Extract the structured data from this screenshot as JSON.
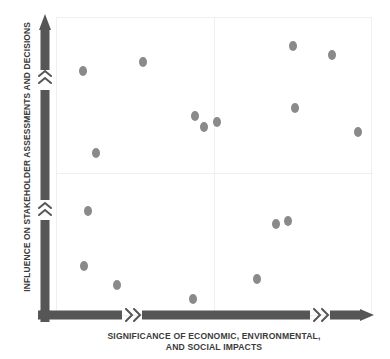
{
  "chart_data": {
    "type": "scatter",
    "title": "",
    "xlabel_line1": "SIGNIFICANCE OF ECONOMIC, ENVIRONMENTAL,",
    "xlabel_line2": "AND SOCIAL IMPACTS",
    "xlabel": "SIGNIFICANCE OF ECONOMIC, ENVIRONMENTAL, AND SOCIAL IMPACTS",
    "ylabel": "INFLUENCE ON STAKEHOLDER ASSESSMENTS AND DECISIONS",
    "xlim": [
      0,
      100
    ],
    "ylim": [
      0,
      100
    ],
    "grid": false,
    "legend": null,
    "quadrant_divider_x": 32,
    "quadrant_divider_y": 48,
    "point_color": "#8a8a8a",
    "axis_color": "#565656",
    "frame_color": "#efefef",
    "points": [
      {
        "x": 8.2,
        "y": 82.3
      },
      {
        "x": 27.2,
        "y": 85.3
      },
      {
        "x": 74.7,
        "y": 90.6
      },
      {
        "x": 87.0,
        "y": 87.6
      },
      {
        "x": 12.3,
        "y": 54.8
      },
      {
        "x": 43.7,
        "y": 67.2
      },
      {
        "x": 46.5,
        "y": 63.5
      },
      {
        "x": 50.6,
        "y": 65.2
      },
      {
        "x": 75.3,
        "y": 69.9
      },
      {
        "x": 95.3,
        "y": 61.9
      },
      {
        "x": 9.8,
        "y": 35.5
      },
      {
        "x": 8.5,
        "y": 17.1
      },
      {
        "x": 19.0,
        "y": 10.7
      },
      {
        "x": 43.0,
        "y": 6.0
      },
      {
        "x": 63.3,
        "y": 12.7
      },
      {
        "x": 69.3,
        "y": 31.1
      },
      {
        "x": 73.1,
        "y": 32.1
      }
    ]
  },
  "axis": {
    "y_arrow_icon": "arrow-up-icon",
    "x_arrow_icon": "arrow-right-icon",
    "break_icon": "chevron-break-icon"
  }
}
